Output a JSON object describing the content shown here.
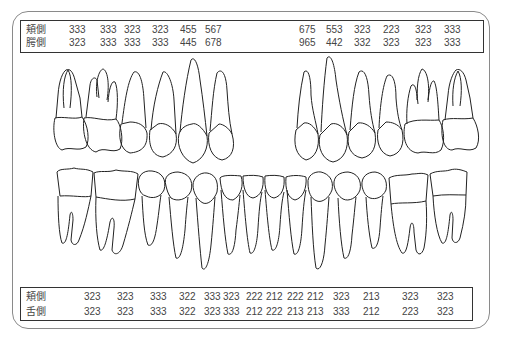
{
  "diagram": {
    "type": "dental-chart",
    "upper_table": {
      "rows": [
        {
          "label": "頬側",
          "values_left": [
            "333",
            "333",
            "323",
            "323",
            "455",
            "567"
          ],
          "values_right": [
            "675",
            "553",
            "323",
            "223",
            "323",
            "333"
          ]
        },
        {
          "label": "口蓋側",
          "label_display": "腭側",
          "values_left": [
            "323",
            "333",
            "333",
            "333",
            "445",
            "678"
          ],
          "values_right": [
            "965",
            "442",
            "332",
            "323",
            "323",
            "333"
          ]
        }
      ]
    },
    "lower_table": {
      "rows": [
        {
          "label": "頬側",
          "values": [
            "323",
            "323",
            "333",
            "322",
            "333",
            "323",
            "222",
            "212",
            "222",
            "212",
            "323",
            "213",
            "323",
            "323"
          ]
        },
        {
          "label": "舌側",
          "values": [
            "323",
            "323",
            "333",
            "322",
            "323",
            "333",
            "212",
            "222",
            "213",
            "213",
            "333",
            "212",
            "223",
            "323"
          ]
        }
      ]
    },
    "upper_teeth_count": 12,
    "lower_teeth_count": 14
  }
}
